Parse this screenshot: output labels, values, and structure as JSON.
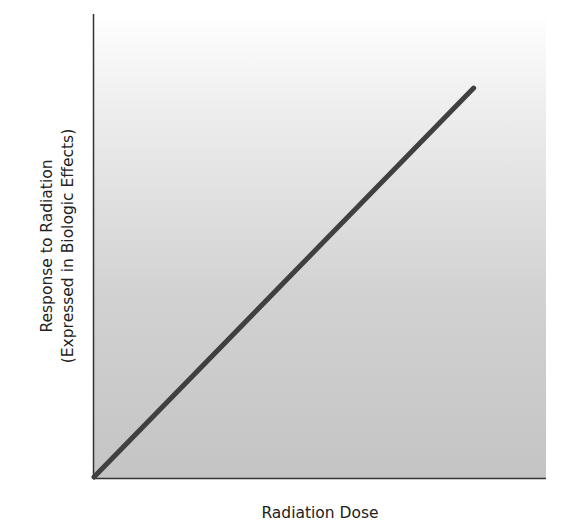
{
  "chart_data": {
    "type": "line",
    "title": "",
    "xlabel": "Radiation Dose",
    "ylabel_lines": [
      "Response to Radiation",
      "(Expressed in Biologic Effects)"
    ],
    "ylabel": "Response to Radiation (Expressed in Biologic Effects)",
    "x_ticks": [],
    "y_ticks": [],
    "grid": false,
    "legend": null,
    "xlim": [
      0,
      1
    ],
    "ylim": [
      0,
      1
    ],
    "series": [
      {
        "name": "Linear nonthreshold dose-response",
        "x": [
          0,
          0.84
        ],
        "y": [
          0,
          0.84
        ],
        "color": "#404040"
      }
    ],
    "annotations": [],
    "background": "gradient white-to-gray"
  }
}
